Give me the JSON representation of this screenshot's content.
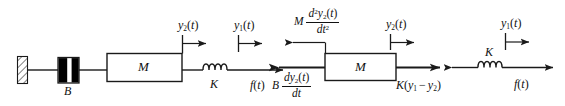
{
  "figure": {
    "type": "engineering-schematic",
    "stroke_color": "#1a1a1a",
    "fill_color": "#000000",
    "background": "#ffffff",
    "width": 565,
    "height": 106
  },
  "left_diagram": {
    "name": "physical-system",
    "wall": {
      "label": "",
      "hatched": true
    },
    "damper": {
      "label": "B",
      "symbol": "dashpot"
    },
    "mass": {
      "label": "M",
      "symbol": "mass-block"
    },
    "spring": {
      "label": "K",
      "symbol": "coil-spring"
    },
    "force": {
      "label_pre": "f",
      "label_var": "t",
      "full": "f(t)"
    },
    "displacement_2": {
      "label_pre": "y",
      "label_sub": "2",
      "label_var": "t",
      "full": "y2(t)"
    },
    "displacement_1": {
      "label_pre": "y",
      "label_sub": "1",
      "label_var": "t",
      "full": "y1(t)"
    }
  },
  "right_diagram": {
    "name": "free-body-diagram",
    "mass": {
      "label": "M",
      "symbol": "mass-block"
    },
    "spring": {
      "label": "K",
      "symbol": "coil-spring"
    },
    "inertia_force": {
      "coef": "M",
      "num_d": "d",
      "num_exp": "2",
      "num_y": "y",
      "num_sub": "2",
      "num_t": "t",
      "den_d": "dt",
      "den_exp": "2",
      "full": "M d^2 y2(t) / dt^2"
    },
    "damping_force": {
      "coef": "B",
      "num_d": "d",
      "num_y": "y",
      "num_sub": "2",
      "num_t": "t",
      "den": "dt",
      "full": "B dy2(t) / dt"
    },
    "spring_force": {
      "coef": "K",
      "open": "(",
      "y_a": "y",
      "sub_a": "1",
      "minus": "−",
      "y_b": "y",
      "sub_b": "2",
      "close": ")",
      "full": "K(y1 − y2)"
    },
    "applied_force": {
      "label_pre": "f",
      "label_var": "t",
      "full": "f(t)"
    },
    "displacement_2": {
      "label_pre": "y",
      "label_sub": "2",
      "label_var": "t",
      "full": "y2(t)"
    },
    "displacement_1": {
      "label_pre": "y",
      "label_sub": "1",
      "label_var": "t",
      "full": "y1(t)"
    }
  }
}
